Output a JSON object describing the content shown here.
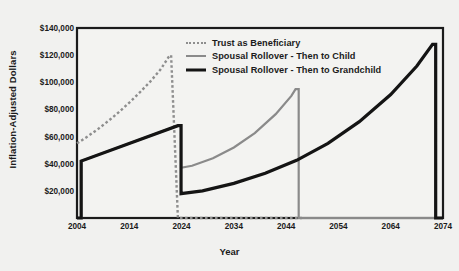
{
  "chart_data": {
    "type": "line",
    "title": "",
    "xlabel": "Year",
    "ylabel": "Inflation-Adjusted Dollars",
    "xlim": [
      2004,
      2074
    ],
    "ylim": [
      0,
      140000
    ],
    "grid": false,
    "legend_position": "top-center",
    "x_ticks": [
      "2004",
      "2014",
      "2024",
      "2034",
      "2044",
      "2054",
      "2064",
      "2074"
    ],
    "x_tick_values": [
      2004,
      2014,
      2024,
      2034,
      2044,
      2054,
      2064,
      2074
    ],
    "y_ticks": [
      "$20,000",
      "$40,000",
      "$60,000",
      "$80,000",
      "$100,000",
      "$120,000",
      "$140,000"
    ],
    "y_tick_values": [
      20000,
      40000,
      60000,
      80000,
      100000,
      120000,
      140000
    ],
    "series": [
      {
        "name": "Trust as Beneficiary",
        "style": "dotted",
        "color": "#8e8e8e",
        "width": 2.4,
        "points": [
          [
            2004,
            55000
          ],
          [
            2006,
            60000
          ],
          [
            2008,
            65500
          ],
          [
            2010,
            71500
          ],
          [
            2012,
            78000
          ],
          [
            2014,
            85000
          ],
          [
            2016,
            92500
          ],
          [
            2018,
            100500
          ],
          [
            2020,
            109500
          ],
          [
            2021.5,
            118500
          ],
          [
            2022,
            120000
          ],
          [
            2023.3,
            0
          ],
          [
            2047,
            0
          ]
        ]
      },
      {
        "name": "Spousal Rollover - Then to Child",
        "style": "solid",
        "color": "#8a8a8a",
        "width": 2.2,
        "points": [
          [
            2004,
            0
          ],
          [
            2004.8,
            0
          ],
          [
            2004.8,
            42000
          ],
          [
            2023.3,
            68000
          ],
          [
            2023.9,
            68000
          ],
          [
            2023.9,
            37000
          ],
          [
            2026,
            38500
          ],
          [
            2030,
            44000
          ],
          [
            2034,
            52000
          ],
          [
            2038,
            62500
          ],
          [
            2042,
            76500
          ],
          [
            2045,
            90000
          ],
          [
            2045.8,
            95000
          ],
          [
            2046.4,
            95000
          ],
          [
            2046.4,
            0
          ],
          [
            2074,
            0
          ]
        ]
      },
      {
        "name": "Spousal Rollover - Then to Grandchild",
        "style": "solid",
        "color": "#141414",
        "width": 3.2,
        "points": [
          [
            2004,
            0
          ],
          [
            2004.8,
            0
          ],
          [
            2004.8,
            42000
          ],
          [
            2023.3,
            68000
          ],
          [
            2023.9,
            68000
          ],
          [
            2023.9,
            18000
          ],
          [
            2028,
            20000
          ],
          [
            2034,
            25500
          ],
          [
            2040,
            33000
          ],
          [
            2046,
            42500
          ],
          [
            2052,
            55000
          ],
          [
            2058,
            71000
          ],
          [
            2064,
            91000
          ],
          [
            2069,
            112000
          ],
          [
            2072,
            128000
          ],
          [
            2072.6,
            128000
          ],
          [
            2072.6,
            0
          ],
          [
            2074,
            0
          ]
        ]
      }
    ]
  },
  "axis": {
    "y_label": "Inflation-Adjusted Dollars",
    "x_label": "Year"
  },
  "legend": {
    "items": [
      {
        "label": "Trust as Beneficiary"
      },
      {
        "label": "Spousal Rollover - Then to Child"
      },
      {
        "label": "Spousal Rollover - Then to Grandchild"
      }
    ]
  },
  "colors": {
    "background": "#f1f1ef",
    "plot_background": "#f3f3f1",
    "axis": "#1b1b1b",
    "trust_line": "#8e8e8e",
    "child_line": "#8a8a8a",
    "grandchild_line": "#141414"
  }
}
